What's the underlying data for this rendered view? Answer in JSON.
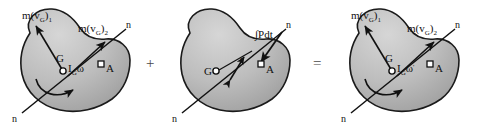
{
  "figure": {
    "width": 482,
    "height": 130,
    "background_color": "#ffffff",
    "body_fill_color": "#b9b9b9",
    "body_outline_color": "#1a1a1a",
    "label_color": "#111111",
    "operator_color": "#4a4a4a"
  },
  "operators": {
    "plus": "+",
    "equals": "="
  },
  "panels": [
    {
      "id": "initial-momenta",
      "name": "Initial momenta diagram",
      "labels": {
        "linear_momentum_1": {
          "base": "m(v",
          "sub1": "G",
          "close": ")",
          "sub2": "1"
        },
        "linear_momentum_2": {
          "base": "m(v",
          "sub1": "G",
          "close": ")",
          "sub2": "2"
        },
        "mass_center": "G",
        "angular_momentum": {
          "base": "I",
          "sub": "G",
          "omega": "ω"
        },
        "point_a": "A",
        "axis_top": "n",
        "axis_bottom": "n"
      }
    },
    {
      "id": "angular-impulse",
      "name": "Angular impulse diagram",
      "labels": {
        "impulse": "∫Pdt",
        "mass_center": "G",
        "moment_arm": "r",
        "point_a": "A",
        "axis_top": "n",
        "axis_bottom": "n"
      }
    },
    {
      "id": "final-momenta",
      "name": "Final momenta diagram",
      "labels": {
        "linear_momentum_1": {
          "base": "m(v",
          "sub1": "G",
          "close": ")",
          "sub2": "1"
        },
        "linear_momentum_2": {
          "base": "m(v",
          "sub1": "G",
          "close": ")",
          "sub2": "2"
        },
        "mass_center": "G",
        "angular_momentum": {
          "base": "I",
          "sub": "G",
          "omega": "ω",
          "prime": "'"
        },
        "point_a": "A",
        "axis_top": "n",
        "axis_bottom": "n"
      }
    }
  ]
}
